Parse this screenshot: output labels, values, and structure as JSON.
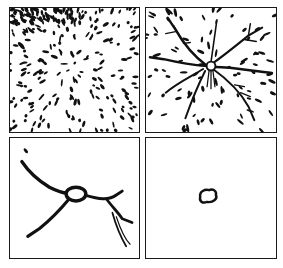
{
  "figure": {
    "caption_fragment": "",
    "layout": "2x2 grid of panels",
    "ink_color": "#111111",
    "background_color": "#ffffff",
    "panels": [
      {
        "position": "top-left",
        "description": "dense field of scattered elongated particles radiating faintly toward a central point",
        "stage": 1
      },
      {
        "position": "top-right",
        "description": "branching network of dark filaments radiating from a small central ring, with scattered particles",
        "stage": 2
      },
      {
        "position": "bottom-left",
        "description": "few thick curved strands meeting at a central ring-shaped node",
        "stage": 3
      },
      {
        "position": "bottom-right",
        "description": "single small closed ring at center of otherwise empty panel",
        "stage": 4
      }
    ]
  }
}
